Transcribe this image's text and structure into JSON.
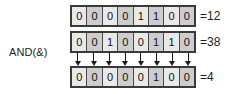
{
  "diagram": {
    "operator_label": "AND(&)",
    "bit_count": 8,
    "colors": {
      "background": "#ffffff",
      "row_border": "#3a3a3a",
      "cell_light": "#e9e9e9",
      "cell_shade": "#cdcdcd",
      "cell_divider": "#4a4a4a",
      "text": "#101010",
      "arrow": "#1a1a1a"
    },
    "rows": [
      {
        "name": "operand-1",
        "bits": [
          "0",
          "0",
          "0",
          "0",
          "1",
          "1",
          "0",
          "0"
        ],
        "value_label": "=12"
      },
      {
        "name": "operand-2",
        "bits": [
          "0",
          "0",
          "1",
          "0",
          "0",
          "1",
          "1",
          "0"
        ],
        "value_label": "=38"
      },
      {
        "name": "result",
        "bits": [
          "0",
          "0",
          "0",
          "0",
          "0",
          "1",
          "0",
          "0"
        ],
        "value_label": "=4"
      }
    ],
    "arrows": {
      "name": "down-arrow-icon",
      "count": 8,
      "direction": "down"
    }
  },
  "chart_data": {
    "type": "table",
    "categories": [
      "bit7",
      "bit6",
      "bit5",
      "bit4",
      "bit3",
      "bit2",
      "bit1",
      "bit0"
    ],
    "series": [
      {
        "name": "=12",
        "values": [
          0,
          0,
          0,
          0,
          1,
          1,
          0,
          0
        ]
      },
      {
        "name": "=38",
        "values": [
          0,
          0,
          1,
          0,
          0,
          1,
          1,
          0
        ]
      },
      {
        "name": "=4",
        "values": [
          0,
          0,
          0,
          0,
          0,
          1,
          0,
          0
        ]
      }
    ],
    "operator": "AND(&)",
    "xlabel": "",
    "ylabel": "",
    "grid": true,
    "legend": "right"
  }
}
